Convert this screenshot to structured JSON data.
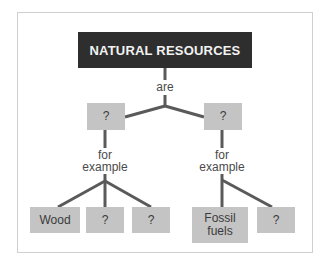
{
  "diagram": {
    "title": "NATURAL RESOURCES",
    "root_link": "are",
    "categories": [
      {
        "label": "?",
        "link": [
          "for",
          "example"
        ],
        "examples": [
          "Wood",
          "?",
          "?"
        ]
      },
      {
        "label": "?",
        "link": [
          "for",
          "example"
        ],
        "examples": [
          "Fossil fuels",
          "?"
        ]
      }
    ],
    "colors": {
      "header_bg": "#2e2e2e",
      "header_text": "#f2f2f2",
      "node_bg": "#c4c4c4",
      "connector": "#5a5a5a",
      "frame_border": "#cfcfcf"
    }
  }
}
